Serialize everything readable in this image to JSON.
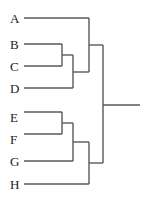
{
  "figure": {
    "kind": "dendrogram",
    "background_color": "#ffffff",
    "line_color": "#595959",
    "label_color": "#1a1a1a",
    "line_width": 1.4,
    "width": 145,
    "height": 203
  },
  "labels": [
    {
      "text": "A",
      "x": 10,
      "y": 12
    },
    {
      "text": "B",
      "x": 10,
      "y": 38
    },
    {
      "text": "C",
      "x": 10,
      "y": 60
    },
    {
      "text": "D",
      "x": 10,
      "y": 82
    },
    {
      "text": "E",
      "x": 10,
      "y": 111
    },
    {
      "text": "F",
      "x": 10,
      "y": 133
    },
    {
      "text": "G",
      "x": 10,
      "y": 155
    },
    {
      "text": "H",
      "x": 10,
      "y": 178
    }
  ],
  "chart_data": {
    "type": "dendrogram",
    "title": "",
    "xlabel": "",
    "ylabel": "",
    "orientation": "horizontal-right",
    "leaves": [
      "A",
      "B",
      "C",
      "D",
      "E",
      "F",
      "G",
      "H"
    ],
    "leaf_positions": [
      18,
      44,
      66,
      88,
      112,
      134,
      161,
      184
    ],
    "leaf_x": 24,
    "root_x": 103,
    "root_stub_end_x": 140,
    "root_y": 105,
    "merges": [
      {
        "name": "BC",
        "children": [
          "B",
          "C"
        ],
        "x": 62,
        "y_top": 44,
        "y_bottom": 66,
        "y_mid": 55
      },
      {
        "name": "BCD",
        "children": [
          "BC",
          "D"
        ],
        "x": 73,
        "y_top": 55,
        "y_bottom": 88,
        "y_mid": 72
      },
      {
        "name": "ABCD",
        "children": [
          "A",
          "BCD"
        ],
        "x": 89,
        "y_top": 18,
        "y_bottom": 72,
        "y_mid": 45
      },
      {
        "name": "EF",
        "children": [
          "E",
          "F"
        ],
        "x": 62,
        "y_top": 112,
        "y_bottom": 134,
        "y_mid": 123
      },
      {
        "name": "EFG",
        "children": [
          "EF",
          "G"
        ],
        "x": 73,
        "y_top": 123,
        "y_bottom": 161,
        "y_mid": 142
      },
      {
        "name": "EFGH",
        "children": [
          "EFG",
          "H"
        ],
        "x": 89,
        "y_top": 142,
        "y_bottom": 184,
        "y_mid": 163
      },
      {
        "name": "ROOT",
        "children": [
          "ABCD",
          "EFGH"
        ],
        "x": 103,
        "y_top": 45,
        "y_bottom": 163,
        "y_mid": 105
      }
    ]
  }
}
